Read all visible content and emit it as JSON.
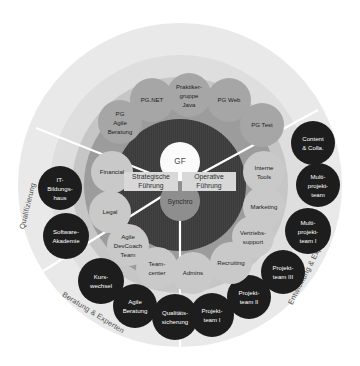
{
  "diagram": {
    "type": "concentric-circle-org-chart",
    "colors": {
      "background": "#ffffff",
      "outer_ring": "#e9e9e9",
      "outer_ring_inner": "#dcdcdc",
      "mid_band": "#9c9c9c",
      "top_band": "#c4c4c4",
      "core_disc": "#3b3b3b",
      "dark_bubble": "#1d1d1d",
      "mid_bubble": "#c9c9c9",
      "pg_bubble": "#a6a6a6",
      "gf_circle": "#fbfbfb",
      "synchro_circle": "#8e8e8e",
      "leadership_band": "#d8d8d8",
      "divider": "#ffffff"
    },
    "center": {
      "gf": "GF",
      "synchro": "Synchro",
      "leadership_left": "Strategische Führung",
      "leadership_left_line1": "Strategische",
      "leadership_left_line2": "Führung",
      "leadership_right": "Operative Führung",
      "leadership_right_line1": "Operative",
      "leadership_right_line2": "Führung"
    },
    "sectors": [
      {
        "id": "qualifizierung",
        "label": "Qualifizierung"
      },
      {
        "id": "beratung-experten",
        "label": "Beratung & Experten"
      },
      {
        "id": "entwicklung-experten",
        "label": "Entwicklung & Experten"
      }
    ],
    "practice_groups": [
      {
        "id": "pg-agile-beratung",
        "lines": [
          "PG",
          "Agile",
          "Beratung"
        ]
      },
      {
        "id": "pg-net",
        "lines": [
          "PG.NET"
        ]
      },
      {
        "id": "praktikergruppe-java",
        "lines": [
          "Praktiker-",
          "gruppe",
          "Java"
        ]
      },
      {
        "id": "pg-web",
        "lines": [
          "PG Web"
        ]
      },
      {
        "id": "pg-test",
        "lines": [
          "PG Test"
        ]
      }
    ],
    "inner_units": [
      {
        "id": "financial",
        "lines": [
          "Financial"
        ]
      },
      {
        "id": "legal",
        "lines": [
          "Legal"
        ]
      },
      {
        "id": "agile-devcoach-team",
        "lines": [
          "Agile",
          "DevCoach",
          "Team"
        ]
      },
      {
        "id": "teamcenter",
        "lines": [
          "Team-",
          "center"
        ]
      },
      {
        "id": "admins",
        "lines": [
          "Admins"
        ]
      },
      {
        "id": "recruiting",
        "lines": [
          "Recruiting"
        ]
      },
      {
        "id": "vertriebssupport",
        "lines": [
          "Vertriebs-",
          "support"
        ]
      },
      {
        "id": "marketing",
        "lines": [
          "Marketing"
        ]
      },
      {
        "id": "interne-tools",
        "lines": [
          "Interne",
          "Tools"
        ]
      }
    ],
    "outer_units": [
      {
        "id": "it-bildungshaus",
        "lines": [
          "IT-",
          "Bildungs-",
          "haus"
        ],
        "sector": "qualifizierung"
      },
      {
        "id": "software-akademie",
        "lines": [
          "Software-",
          "Akademie"
        ],
        "sector": "qualifizierung"
      },
      {
        "id": "kurswechsel",
        "lines": [
          "Kurs-",
          "wechsel"
        ],
        "sector": "beratung-experten"
      },
      {
        "id": "agile-beratung",
        "lines": [
          "Agile",
          "Beratung"
        ],
        "sector": "beratung-experten"
      },
      {
        "id": "qualitaetssicherung",
        "lines": [
          "Qualitäts-",
          "sicherung"
        ],
        "sector": "beratung-experten"
      },
      {
        "id": "projektteam-i",
        "lines": [
          "Projekt-",
          "team I"
        ],
        "sector": "entwicklung-experten"
      },
      {
        "id": "projektteam-ii",
        "lines": [
          "Projekt-",
          "team II"
        ],
        "sector": "entwicklung-experten"
      },
      {
        "id": "projektteam-iii",
        "lines": [
          "Projekt-",
          "team III"
        ],
        "sector": "entwicklung-experten"
      },
      {
        "id": "multiprojektteam-i",
        "lines": [
          "Multi-",
          "projekt-",
          "team I"
        ],
        "sector": "entwicklung-experten"
      },
      {
        "id": "multiprojektteam",
        "lines": [
          "Multi-",
          "projekt-",
          "team"
        ],
        "sector": "entwicklung-experten"
      },
      {
        "id": "content-colla",
        "lines": [
          "Content",
          "& Colla."
        ],
        "sector": "entwicklung-experten"
      }
    ]
  }
}
